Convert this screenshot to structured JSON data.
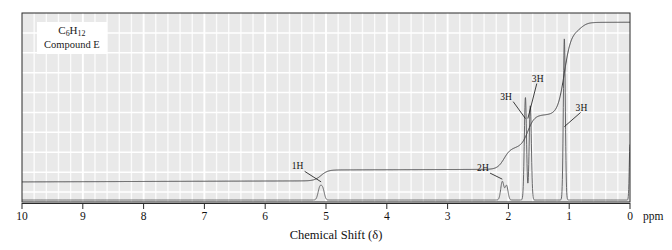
{
  "figure": {
    "kind": "nmr-spectrum",
    "compound_label_line1": "C6H12",
    "compound_label_line1_parts": {
      "c": "C",
      "c_sub": "6",
      "h": "H",
      "h_sub": "12"
    },
    "compound_label_line2": "Compound E",
    "xaxis_title": "Chemical Shift (δ)",
    "xaxis_unit": "ppm"
  },
  "colors": {
    "plot_background": "#e9e9e9",
    "grid": "#ffffff",
    "trace": "#58585a",
    "integral": "#3c3c3e",
    "axis": "#2b2b2b",
    "text": "#111111",
    "page_background": "#ffffff"
  },
  "chart_data": {
    "type": "line",
    "title": "",
    "subtitle": "",
    "xlabel": "Chemical Shift (δ)",
    "ylabel": "",
    "xlim": [
      10,
      0
    ],
    "ylim": [
      0,
      1
    ],
    "x_unit": "ppm",
    "x_reversed": true,
    "grid": true,
    "legend": null,
    "xticks": [
      10,
      9,
      8,
      7,
      6,
      5,
      4,
      3,
      2,
      1,
      0
    ],
    "xtick_labels": [
      "10",
      "9",
      "8",
      "7",
      "6",
      "5",
      "4",
      "3",
      "2",
      "1",
      "0"
    ],
    "minor_tick_step": 0.2,
    "peaks": [
      {
        "shift": 5.1,
        "height": 0.075,
        "width": 0.03,
        "integration": "1H",
        "label": "1H"
      },
      {
        "shift": 5.05,
        "height": 0.055,
        "width": 0.026,
        "integration": null,
        "label": null
      },
      {
        "shift": 2.1,
        "height": 0.11,
        "width": 0.026,
        "integration": "2H",
        "label": "2H"
      },
      {
        "shift": 2.03,
        "height": 0.085,
        "width": 0.024,
        "integration": null,
        "label": null
      },
      {
        "shift": 1.72,
        "height": 0.61,
        "width": 0.018,
        "integration": "3H",
        "label": "3H"
      },
      {
        "shift": 1.64,
        "height": 0.56,
        "width": 0.018,
        "integration": "3H",
        "label": "3H"
      },
      {
        "shift": 1.08,
        "height": 0.96,
        "width": 0.016,
        "integration": "3H",
        "label": "3H"
      },
      {
        "shift": 0.0,
        "height": 0.33,
        "width": 0.012,
        "integration": null,
        "label": "TMS"
      }
    ],
    "integration_curve": {
      "description": "cumulative integral trace rising left to right with step heights proportional to proton counts",
      "steps": [
        {
          "shift": 5.08,
          "rise": 0.06,
          "label": "1H"
        },
        {
          "shift": 2.07,
          "rise": 0.12,
          "label": "2H"
        },
        {
          "shift": 1.68,
          "rise": 0.18,
          "label": "3H+3H"
        },
        {
          "shift": 1.08,
          "rise": 0.46,
          "label": "3H"
        },
        {
          "shift": 0.8,
          "rise": 0.05,
          "label": ""
        }
      ],
      "baseline": 0.1,
      "top": 0.97
    },
    "annotations": [
      {
        "text": "1H",
        "shift": 5.45,
        "y": 0.175,
        "leader_to_shift": 5.08,
        "leader_to_y": 0.1
      },
      {
        "text": "2H",
        "shift": 2.4,
        "y": 0.165,
        "leader_to_shift": 2.1,
        "leader_to_y": 0.115
      },
      {
        "text": "3H",
        "shift": 2.02,
        "y": 0.56,
        "leader_to_shift": 1.72,
        "leader_to_y": 0.45
      },
      {
        "text": "3H",
        "shift": 1.5,
        "y": 0.66,
        "leader_to_shift": 1.68,
        "leader_to_y": 0.45
      },
      {
        "text": "3H",
        "shift": 0.78,
        "y": 0.5,
        "leader_to_shift": 1.08,
        "leader_to_y": 0.405
      }
    ]
  },
  "axis_labels": {
    "ticks": [
      "10",
      "9",
      "8",
      "7",
      "6",
      "5",
      "4",
      "3",
      "2",
      "1",
      "0"
    ],
    "unit": "ppm"
  },
  "annotation_texts": {
    "a1": "1H",
    "a2": "2H",
    "a3": "3H",
    "a4": "3H",
    "a5": "3H"
  }
}
